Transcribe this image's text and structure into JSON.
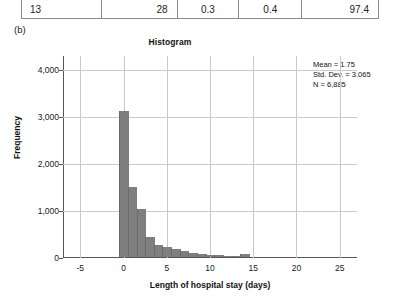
{
  "table_fragment": {
    "row": [
      "13",
      "28",
      "0.3",
      "0.4",
      "97.4"
    ]
  },
  "panel_label": "(b)",
  "figure": {
    "title": "Histogram",
    "ylabel": "Frequency",
    "xlabel": "Length of hospital stay (days)",
    "stats": {
      "mean": "Mean = 1.75",
      "std_dev": "Std. Dev. = 3.065",
      "n": "N = 6,885"
    }
  },
  "chart_data": {
    "type": "bar",
    "title": "Histogram",
    "xlabel": "Length of hospital stay (days)",
    "ylabel": "Frequency",
    "xlim": [
      -7,
      27
    ],
    "ylim": [
      0,
      4300
    ],
    "grid": true,
    "legend": null,
    "bar_color": "#7f7f7f",
    "xticks": [
      -5,
      0,
      5,
      10,
      15,
      20,
      25
    ],
    "xtick_labels": [
      "-5",
      "0",
      "5",
      "10",
      "15",
      "20",
      "25"
    ],
    "yticks": [
      0,
      1000,
      2000,
      3000,
      4000
    ],
    "ytick_labels": [
      "0",
      "1,000",
      "2,000",
      "3,000",
      "4,000"
    ],
    "bin_width": 1,
    "annotations": [
      "Mean = 1.75",
      "Std. Dev. = 3.065",
      "N = 6,885"
    ],
    "x": [
      0,
      1,
      2,
      3,
      4,
      5,
      6,
      7,
      8,
      9,
      10,
      11,
      12,
      13,
      14
    ],
    "values": [
      3100,
      1490,
      1020,
      420,
      260,
      210,
      170,
      120,
      80,
      70,
      45,
      35,
      28,
      25,
      55
    ],
    "categories": [
      "0",
      "1",
      "2",
      "3",
      "4",
      "5",
      "6",
      "7",
      "8",
      "9",
      "10",
      "11",
      "12",
      "13",
      "14"
    ]
  }
}
